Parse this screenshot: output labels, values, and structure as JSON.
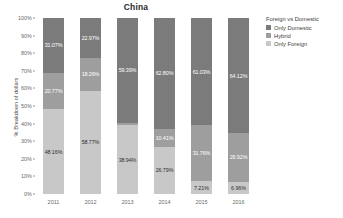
{
  "chart_data": {
    "type": "bar",
    "stacked": true,
    "title": "China",
    "xlabel": "",
    "ylabel": "% Breakdown of dollars",
    "categories": [
      "2011",
      "2012",
      "2013",
      "2014",
      "2015",
      "2016"
    ],
    "ylim": [
      0,
      100
    ],
    "ytick_labels": [
      "0%",
      "10%",
      "20%",
      "30%",
      "40%",
      "50%",
      "60%",
      "70%",
      "80%",
      "90%",
      "100%"
    ],
    "ytick_values": [
      0,
      10,
      20,
      30,
      40,
      50,
      60,
      70,
      80,
      90,
      100
    ],
    "grid": false,
    "legend_position": "right",
    "legend_title": "Foreign vs Domestic",
    "series": [
      {
        "name": "Only Domestic",
        "color": "#7b7b7b",
        "values": [
          31.07,
          22.97,
          59.39,
          62.8,
          61.03,
          64.12
        ],
        "labels": [
          "31.07%",
          "22.97%",
          "59.39%",
          "62.80%",
          "61.03%",
          "64.12%"
        ]
      },
      {
        "name": "Hybrid",
        "color": "#9e9e9e",
        "values": [
          20.77,
          18.26,
          1.67,
          10.41,
          31.76,
          26.92
        ],
        "labels": [
          "20.77%",
          "18.26%",
          "",
          "10.41%",
          "31.76%",
          "26.92%"
        ]
      },
      {
        "name": "Only Foreign",
        "color": "#c8c8c8",
        "values": [
          48.16,
          58.77,
          38.94,
          26.79,
          7.21,
          6.96
        ],
        "labels": [
          "48.16%",
          "58.77%",
          "38.94%",
          "26.79%",
          "7.21%",
          "6.96%"
        ]
      }
    ]
  },
  "colors": {
    "only_domestic": "#7b7b7b",
    "hybrid": "#9e9e9e",
    "only_foreign": "#c8c8c8",
    "background": "#ffffff",
    "text": "#3d3d3d",
    "axis_text": "#6a6a6a"
  }
}
